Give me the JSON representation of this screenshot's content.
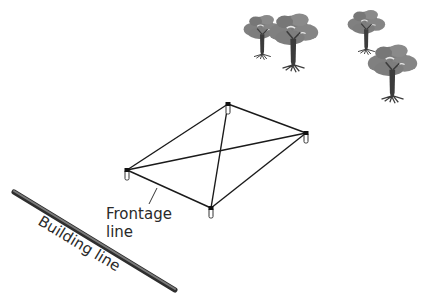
{
  "diagram": {
    "type": "site-layout",
    "labels": {
      "frontage_line_1": "Frontage",
      "frontage_line_2": "line",
      "building_line": "Building line"
    },
    "stakes": [
      {
        "id": "left",
        "x": 127,
        "y": 170
      },
      {
        "id": "bottom",
        "x": 211,
        "y": 208
      },
      {
        "id": "right",
        "x": 306,
        "y": 133
      },
      {
        "id": "top",
        "x": 228,
        "y": 104
      }
    ],
    "colors": {
      "string_line": "#1a1a1a",
      "building_line": "#5a5a5a",
      "tree_foliage": "#7a7a7a",
      "tree_trunk": "#3c3c3c",
      "text": "#2a2a2a"
    },
    "trees": [
      {
        "id": "tree-1",
        "x": 262,
        "y": 55,
        "scale": 0.8
      },
      {
        "id": "tree-2",
        "x": 293,
        "y": 65,
        "scale": 1.05
      },
      {
        "id": "tree-3",
        "x": 366,
        "y": 50,
        "scale": 0.8
      },
      {
        "id": "tree-4",
        "x": 392,
        "y": 97,
        "scale": 1.05
      }
    ]
  }
}
